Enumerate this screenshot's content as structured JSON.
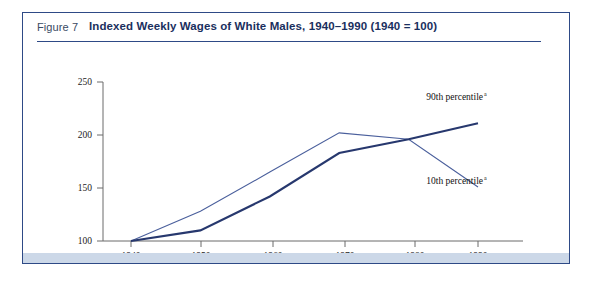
{
  "figure": {
    "number_label": "Figure 7",
    "title": "Indexed Weekly Wages of White Males, 1940–1990 (1940 = 100)"
  },
  "chart_data": {
    "type": "line",
    "title": "Indexed Weekly Wages of White Males, 1940–1990 (1940 = 100)",
    "xlabel": "",
    "ylabel": "",
    "x": [
      1940,
      1950,
      1960,
      1970,
      1980,
      1990
    ],
    "xtick_labels": [
      "1940",
      "1950",
      "1960",
      "1970",
      "1980",
      "1990"
    ],
    "ytick_labels": [
      "100",
      "150",
      "200",
      "250"
    ],
    "yticks": [
      100,
      150,
      200,
      250
    ],
    "ylim": [
      100,
      250
    ],
    "xlim": [
      1935,
      1995
    ],
    "grid": false,
    "legend": "inline-annotation",
    "series": [
      {
        "name": "90th percentile",
        "footnote_marker": "a",
        "label": "90th percentile",
        "color": "#27386e",
        "values": [
          100,
          110,
          142,
          183,
          196,
          211
        ]
      },
      {
        "name": "10th percentile",
        "footnote_marker": "a",
        "label": "10th percentile",
        "color": "#4a5f9c",
        "values": [
          100,
          128,
          165,
          202,
          196,
          151
        ]
      }
    ],
    "annotations": [
      {
        "text": "90th percentile",
        "sup": "a",
        "x": 1989,
        "y": 228
      },
      {
        "text": "10th percentile",
        "sup": "a",
        "x": 1986,
        "y": 158
      }
    ]
  },
  "colors": {
    "border": "#2e4a86",
    "title": "#1a2f5e",
    "figure_number": "#3a4a63",
    "band": "#ccd8e8",
    "axis": "#6b6b6b",
    "series_90": "#27386e",
    "series_10": "#4a5f9c"
  }
}
